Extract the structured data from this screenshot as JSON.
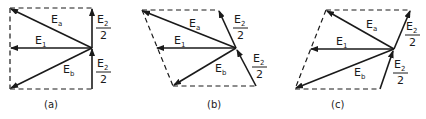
{
  "figure": {
    "labels": {
      "Ea_main": "E",
      "Ea_sub": "a",
      "Eb_main": "E",
      "Eb_sub": "b",
      "E1_main": "E",
      "E1_sub": "1",
      "E2_main": "E",
      "E2_sub": "2",
      "denominator": "2"
    },
    "panels": [
      {
        "id": "a",
        "caption": "(a)"
      },
      {
        "id": "b",
        "caption": "(b)"
      },
      {
        "id": "c",
        "caption": "(c)"
      }
    ]
  }
}
